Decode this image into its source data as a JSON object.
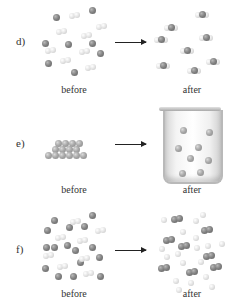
{
  "panels": [
    {
      "id": "d",
      "label": "d)",
      "before_caption": "before",
      "after_caption": "after",
      "before": {
        "dark_atoms": [
          [
            56,
            17
          ],
          [
            92,
            10
          ],
          [
            45,
            43
          ],
          [
            68,
            44
          ],
          [
            92,
            43
          ],
          [
            100,
            53
          ],
          [
            48,
            63
          ],
          [
            74,
            72
          ]
        ],
        "light_pairs": [
          [
            74,
            15
          ],
          [
            101,
            26
          ],
          [
            61,
            31
          ],
          [
            86,
            35
          ],
          [
            50,
            50
          ],
          [
            84,
            51
          ],
          [
            65,
            60
          ],
          [
            90,
            67
          ]
        ]
      },
      "after": {
        "triatomic_molecules": [
          [
            171,
            27
          ],
          [
            161,
            39
          ],
          [
            202,
            14
          ],
          [
            206,
            37
          ],
          [
            187,
            50
          ],
          [
            163,
            65
          ],
          [
            194,
            70
          ],
          [
            213,
            61
          ]
        ]
      }
    },
    {
      "id": "e",
      "label": "e)",
      "before_caption": "before",
      "after_caption": "after",
      "before": {
        "solid_lattice_atoms": [
          [
            55,
            149
          ],
          [
            62,
            149
          ],
          [
            69,
            149
          ],
          [
            76,
            149
          ],
          [
            58,
            143
          ],
          [
            65,
            143
          ],
          [
            72,
            143
          ],
          [
            79,
            143
          ],
          [
            62,
            155
          ],
          [
            69,
            155
          ],
          [
            76,
            155
          ],
          [
            48,
            155
          ],
          [
            55,
            155
          ],
          [
            83,
            155
          ]
        ]
      },
      "after": {
        "container": "beaker",
        "dissolved_atoms": [
          [
            183,
            130
          ],
          [
            209,
            132
          ],
          [
            198,
            147
          ],
          [
            178,
            148
          ],
          [
            190,
            158
          ],
          [
            208,
            160
          ],
          [
            182,
            173
          ],
          [
            200,
            172
          ]
        ]
      }
    },
    {
      "id": "f",
      "label": "f)",
      "before_caption": "before",
      "after_caption": "after",
      "before": {
        "dark_atoms": [
          [
            54,
            220
          ],
          [
            92,
            215
          ],
          [
            47,
            230
          ],
          [
            69,
            227
          ],
          [
            84,
            226
          ],
          [
            46,
            247
          ],
          [
            54,
            247
          ],
          [
            67,
            245
          ],
          [
            75,
            250
          ],
          [
            92,
            247
          ],
          [
            99,
            257
          ],
          [
            45,
            268
          ],
          [
            58,
            276
          ],
          [
            73,
            276
          ],
          [
            100,
            276
          ],
          [
            80,
            262
          ]
        ],
        "light_pairs": [
          [
            75,
            221
          ],
          [
            100,
            230
          ],
          [
            60,
            237
          ],
          [
            82,
            240
          ],
          [
            48,
            255
          ],
          [
            84,
            258
          ],
          [
            62,
            266
          ],
          [
            88,
            273
          ]
        ]
      },
      "after": {
        "dark_pairs": [
          [
            177,
            219
          ],
          [
            207,
            230
          ],
          [
            169,
            240
          ],
          [
            184,
            246
          ],
          [
            209,
            256
          ],
          [
            164,
            268
          ],
          [
            192,
            272
          ],
          [
            216,
            267
          ]
        ],
        "light_atoms": [
          [
            164,
            220
          ],
          [
            196,
            221
          ],
          [
            203,
            215
          ],
          [
            183,
            232
          ],
          [
            196,
            238
          ],
          [
            197,
            248
          ],
          [
            162,
            249
          ],
          [
            178,
            254
          ],
          [
            208,
            246
          ],
          [
            222,
            244
          ],
          [
            167,
            257
          ],
          [
            183,
            263
          ],
          [
            201,
            262
          ],
          [
            176,
            281
          ],
          [
            191,
            283
          ],
          [
            206,
            277
          ],
          [
            212,
            287
          ],
          [
            179,
            290
          ]
        ]
      }
    }
  ],
  "arrows": [
    {
      "panel": "d",
      "x": 115,
      "y": 42,
      "length": 30
    },
    {
      "panel": "e",
      "x": 115,
      "y": 144,
      "length": 30
    },
    {
      "panel": "f",
      "x": 115,
      "y": 250,
      "length": 30
    }
  ],
  "colors": {
    "dark_atom": "#7a7a7a",
    "light_atom": "#e6e6e6",
    "text": "#333333",
    "arrow": "#222222"
  }
}
